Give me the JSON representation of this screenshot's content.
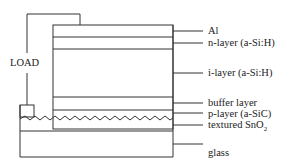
{
  "diagram": {
    "load_label": "LOAD",
    "layers": [
      {
        "id": "al",
        "label": "Al"
      },
      {
        "id": "n-layer",
        "label": "n-layer  (a-Si:H)"
      },
      {
        "id": "i-layer",
        "label": "i-layer  (a-Si:H)"
      },
      {
        "id": "buffer-layer",
        "label": "buffer  layer"
      },
      {
        "id": "p-layer",
        "label": "p-layer  (a-SiC)"
      },
      {
        "id": "tco",
        "label": "textured  SnO",
        "subscript": "2"
      },
      {
        "id": "glass",
        "label": "glass"
      }
    ],
    "line_color": "#333333"
  }
}
